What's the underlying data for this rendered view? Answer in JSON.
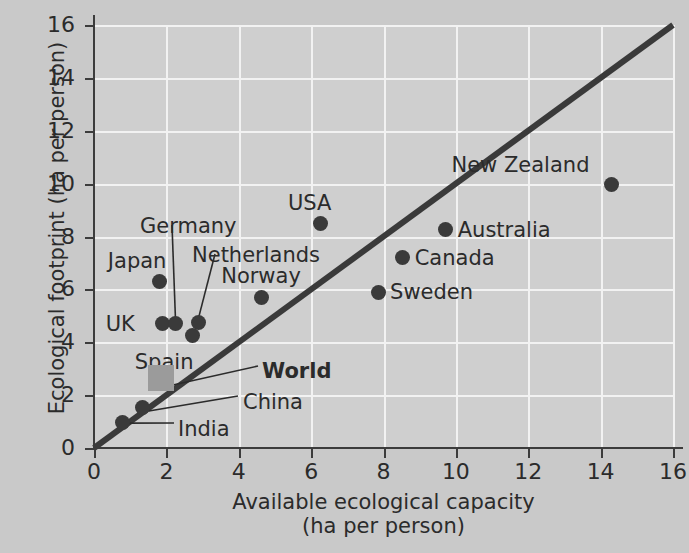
{
  "chart_data": {
    "type": "scatter",
    "title": "",
    "xlabel": "Available ecological capacity",
    "xlabel_units": "(ha per person)",
    "ylabel": "Ecological footprint (ha per person)",
    "xlim": [
      0,
      16
    ],
    "ylim": [
      0,
      16
    ],
    "xticks": [
      "0",
      "2",
      "4",
      "6",
      "8",
      "10",
      "12",
      "14",
      "16"
    ],
    "yticks": [
      "0",
      "2",
      "4",
      "6",
      "8",
      "10",
      "12",
      "14",
      "16"
    ],
    "grid": true,
    "legend_position": "none",
    "reference_line": {
      "name": "sustainability-line",
      "description": "y = x diagonal",
      "from": [
        0,
        0
      ],
      "to": [
        16,
        16
      ],
      "color": "#3a3a3a"
    },
    "colors": {
      "background": "#c9c9c9",
      "plot_background": "#cfcfcf",
      "gridline": "#f2f2f2",
      "marker": "#3a3a3a",
      "world_marker": "#9b9b9b",
      "text": "#2b2b2b"
    },
    "points": [
      {
        "name": "New Zealand",
        "x": 14.3,
        "y": 9.95,
        "marker": "circle",
        "label_dx": -160,
        "label_dy": -30,
        "leader": false
      },
      {
        "name": "USA",
        "x": 6.27,
        "y": 8.5,
        "marker": "circle",
        "label_dx": -33,
        "label_dy": -30,
        "leader": false
      },
      {
        "name": "Australia",
        "x": 9.72,
        "y": 8.25,
        "marker": "circle",
        "label_dx": 12,
        "label_dy": -10,
        "leader": false
      },
      {
        "name": "Canada",
        "x": 8.53,
        "y": 7.2,
        "marker": "circle",
        "label_dx": 12,
        "label_dy": -10,
        "leader": false
      },
      {
        "name": "Japan",
        "x": 1.82,
        "y": 6.3,
        "marker": "circle",
        "label_dx": -52,
        "label_dy": -30,
        "leader": false
      },
      {
        "name": "Sweden",
        "x": 7.85,
        "y": 5.9,
        "marker": "circle",
        "label_dx": 12,
        "label_dy": -10,
        "leader": false
      },
      {
        "name": "Norway",
        "x": 4.62,
        "y": 5.7,
        "marker": "circle",
        "label_dx": -40,
        "label_dy": -31,
        "leader": false
      },
      {
        "name": "UK",
        "x": 1.9,
        "y": 4.7,
        "marker": "circle",
        "label_dx": -57,
        "label_dy": -10,
        "leader": false
      },
      {
        "name": "Germany",
        "x": 2.25,
        "y": 4.7,
        "marker": "circle",
        "label_dx": 0,
        "label_dy": 0,
        "leader": true
      },
      {
        "name": "Netherlands",
        "x": 2.9,
        "y": 4.75,
        "marker": "circle",
        "label_dx": 0,
        "label_dy": 0,
        "leader": true
      },
      {
        "name": "Spain",
        "x": 2.73,
        "y": 4.25,
        "marker": "circle",
        "label_dx": -58,
        "label_dy": 16,
        "leader": false
      },
      {
        "name": "World",
        "x": 1.85,
        "y": 2.65,
        "marker": "square",
        "label_dx": 0,
        "label_dy": 0,
        "leader": true,
        "bold": true
      },
      {
        "name": "China",
        "x": 1.35,
        "y": 1.55,
        "marker": "circle",
        "label_dx": 0,
        "label_dy": 0,
        "leader": true
      },
      {
        "name": "India",
        "x": 0.8,
        "y": 0.98,
        "marker": "circle",
        "label_dx": 0,
        "label_dy": 0,
        "leader": true
      }
    ],
    "leader_labels": [
      {
        "name": "Germany",
        "text": "Germany",
        "x": 140,
        "y": 216
      },
      {
        "name": "Netherlands",
        "text": "Netherlands",
        "x": 192,
        "y": 245
      },
      {
        "name": "World",
        "text": "World",
        "x": 262,
        "y": 361,
        "bold": true
      },
      {
        "name": "China",
        "text": "China",
        "x": 243,
        "y": 392
      },
      {
        "name": "India",
        "text": "India",
        "x": 178,
        "y": 419
      }
    ]
  }
}
